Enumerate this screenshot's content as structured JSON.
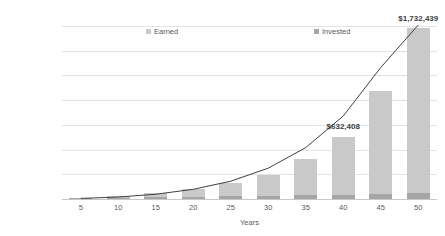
{
  "chart_data": {
    "type": "bar",
    "title": "",
    "subtitle": "",
    "xlabel": "Years",
    "ylabel": "",
    "categories": [
      "5",
      "10",
      "15",
      "20",
      "25",
      "30",
      "35",
      "40",
      "45",
      "50"
    ],
    "series": [
      {
        "name": "Invested",
        "color": "#a6a6a6",
        "values": [
          30000,
          60000,
          90000,
          120000,
          150000,
          180000,
          210000,
          240000,
          270000,
          300000
        ]
      },
      {
        "name": "Earned",
        "color": "#c9c9c9",
        "values": [
          5000,
          22000,
          60000,
          130000,
          250000,
          440000,
          760000,
          1140000,
          1970000,
          3160000
        ]
      }
    ],
    "stacked_totals": [
      35000,
      82000,
      150000,
      250000,
      400000,
      620000,
      970000,
      1380000,
      2240000,
      3460000
    ],
    "bar_totals_displayed": [
      8000,
      28000,
      62000,
      105000,
      160000,
      248000,
      400000,
      632408,
      1090000,
      1732439
    ],
    "overlay_line": {
      "name": "growth-curve",
      "color": "#404040",
      "x": [
        "5",
        "10",
        "15",
        "20",
        "25",
        "30",
        "35",
        "40",
        "45",
        "50"
      ],
      "values": [
        6000,
        20000,
        48000,
        98000,
        180000,
        312000,
        520000,
        840000,
        1330000,
        1760000
      ]
    },
    "ylim": [
      0,
      1750000
    ],
    "yticks": [
      0,
      250000,
      500000,
      750000,
      1000000,
      1250000,
      1500000,
      1750000
    ],
    "ytick_labels": [
      "$0",
      "$250,000",
      "$500,000",
      "$750,000",
      "$1,000,000",
      "$1,250,000",
      "$1,500,000",
      "$1,750,000"
    ],
    "grid": true,
    "legend_position": "top-inside",
    "annotations": [
      {
        "text": "$632,408",
        "category": "40",
        "value": 632408
      },
      {
        "text": "$1,732,439",
        "category": "50",
        "value": 1732439
      }
    ]
  },
  "legend": {
    "earned": "Earned",
    "invested": "Invested"
  },
  "axis": {
    "x_title": "Years"
  }
}
